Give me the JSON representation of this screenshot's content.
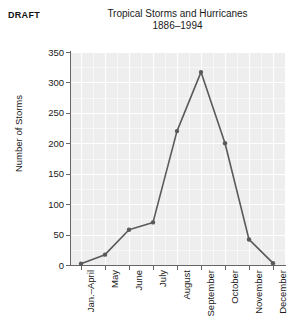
{
  "watermark": {
    "label": "DRAFT"
  },
  "chart": {
    "title_line1": "Tropical Storms and Hurricanes",
    "title_line2": "1886–1994"
  },
  "chart_data": {
    "type": "line",
    "title": "Tropical Storms and Hurricanes 1886–1994",
    "xlabel": "",
    "ylabel": "Number of Storms",
    "categories": [
      "Jan.–April",
      "May",
      "June",
      "July",
      "August",
      "September",
      "October",
      "November",
      "December"
    ],
    "values": [
      2,
      17,
      58,
      70,
      220,
      317,
      200,
      42,
      3
    ],
    "ylim": [
      0,
      350
    ],
    "yticks": [
      0,
      50,
      100,
      150,
      200,
      250,
      300,
      350
    ],
    "ytick_labels": [
      "0",
      "50",
      "100",
      "150",
      "200",
      "250",
      "300",
      "350"
    ],
    "grid": true,
    "legend": "none",
    "series": [
      {
        "name": "Number of Storms",
        "values": [
          2,
          17,
          58,
          70,
          220,
          317,
          200,
          42,
          3
        ]
      }
    ],
    "marker": "circle",
    "line_color": "#5a5a5a",
    "plot_background": "#eeeeee",
    "gridline_color": "#ffffff"
  }
}
